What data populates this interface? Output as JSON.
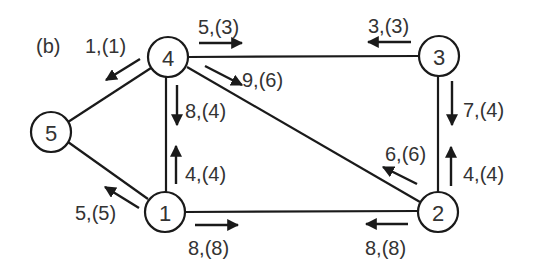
{
  "panel_label": "(b)",
  "nodes": [
    {
      "id": "1",
      "label": "1",
      "x": 165,
      "y": 212
    },
    {
      "id": "2",
      "label": "2",
      "x": 438,
      "y": 212
    },
    {
      "id": "3",
      "label": "3",
      "x": 439,
      "y": 56
    },
    {
      "id": "4",
      "label": "4",
      "x": 168,
      "y": 57
    },
    {
      "id": "5",
      "label": "5",
      "x": 51,
      "y": 132
    }
  ],
  "edges": [
    {
      "from": "4",
      "to": "3"
    },
    {
      "from": "4",
      "to": "5"
    },
    {
      "from": "4",
      "to": "1"
    },
    {
      "from": "4",
      "to": "2"
    },
    {
      "from": "5",
      "to": "1"
    },
    {
      "from": "1",
      "to": "2"
    },
    {
      "from": "3",
      "to": "2"
    }
  ],
  "flows": [
    {
      "label": "5,(3)",
      "from": "4",
      "to": "3"
    },
    {
      "label": "3,(3)",
      "from": "3",
      "to": "4"
    },
    {
      "label": "1,(1)",
      "from": "4",
      "to": "5"
    },
    {
      "label": "9,(6)",
      "from": "4",
      "to": "2"
    },
    {
      "label": "8,(4)",
      "from": "4",
      "to": "1"
    },
    {
      "label": "4,(4)",
      "from": "1",
      "to": "4"
    },
    {
      "label": "5,(5)",
      "from": "1",
      "to": "5"
    },
    {
      "label": "8,(8)",
      "from": "1",
      "to": "2"
    },
    {
      "label": "8,(8)",
      "from": "2",
      "to": "1"
    },
    {
      "label": "6,(6)",
      "from": "2",
      "to": "4"
    },
    {
      "label": "7,(4)",
      "from": "3",
      "to": "2"
    },
    {
      "label": "4,(4)",
      "from": "2",
      "to": "3"
    }
  ]
}
